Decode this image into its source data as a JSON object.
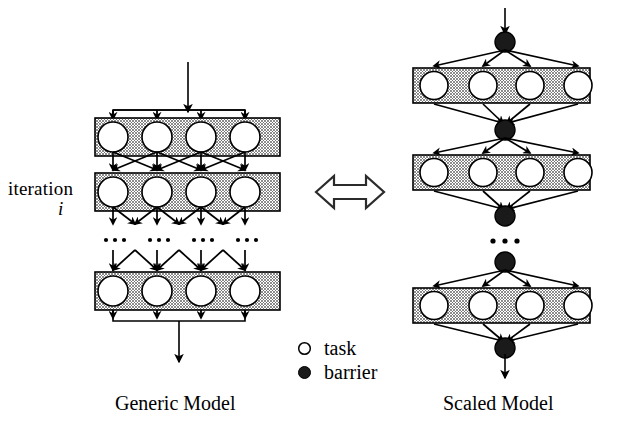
{
  "figure": {
    "kind": "diagram"
  },
  "labels": {
    "iteration": "iteration",
    "iteration_index": "i",
    "generic_model": "Generic Model",
    "scaled_model": "Scaled Model",
    "ellipsis": "• • •"
  },
  "legend": {
    "items": [
      {
        "symbol": "open-circle",
        "label": "task"
      },
      {
        "symbol": "filled-circle",
        "label": "barrier"
      }
    ]
  },
  "equivalence": {
    "symbol": "double-headed-arrow",
    "meaning": "equivalent to"
  },
  "colors": {
    "stroke": "#000000",
    "band_fill": "#9a9a9a",
    "task_fill": "#ffffff",
    "barrier_fill": "#1a1a1a",
    "background": "#ffffff"
  },
  "generic_model": {
    "bands": 3,
    "tasks_per_band": 4,
    "has_input_bus": true,
    "has_output_bus": true,
    "ellipsis_groups": 4
  },
  "scaled_model": {
    "bands": 3,
    "tasks_per_band": 4,
    "barriers": 5,
    "ellipsis_groups": 1
  }
}
